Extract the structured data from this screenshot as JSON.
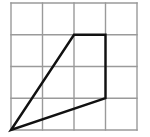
{
  "figure": {
    "background_color": "#ffffff",
    "grid": {
      "columns": 4,
      "rows": 4,
      "line_color": "#9a9a9a",
      "line_width": 1.4,
      "origin_x": 11,
      "origin_y": 3,
      "cell_width": 31.5,
      "cell_height": 31.75,
      "x_lines": [
        11,
        42.5,
        74,
        105.5,
        137
      ],
      "y_lines": [
        3,
        34.75,
        66.5,
        98.25,
        130
      ]
    },
    "shape": {
      "name": "quadrilateral",
      "stroke_color": "#111111",
      "stroke_width": 2.4,
      "fill": "none",
      "vertices_grid": [
        {
          "label": "bottom-left",
          "col": 0,
          "row": 4
        },
        {
          "label": "top-left",
          "col": 2,
          "row": 1
        },
        {
          "label": "top-right",
          "col": 3,
          "row": 1
        },
        {
          "label": "right",
          "col": 3,
          "row": 3
        }
      ],
      "vertices_px": [
        {
          "label": "bottom-left",
          "x": 11,
          "y": 130
        },
        {
          "label": "top-left",
          "x": 74,
          "y": 34.75
        },
        {
          "label": "top-right",
          "x": 105.5,
          "y": 34.75
        },
        {
          "label": "right",
          "x": 105.5,
          "y": 98.25
        }
      ],
      "points_attr": "11,130 74,34.75 105.5,34.75 105.5,98.25"
    }
  }
}
